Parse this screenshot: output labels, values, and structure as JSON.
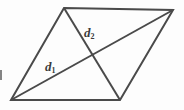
{
  "figure": {
    "name": "parallelogram-with-diagonals",
    "background_color": "#fdfdfd",
    "stroke_color": "#4a4a4a",
    "stroke_width": 2,
    "label_color": "#3a3a3a",
    "canvas": {
      "width": 184,
      "height": 110
    },
    "vertices": {
      "top_left": {
        "x": 64,
        "y": 8
      },
      "top_right": {
        "x": 173,
        "y": 10
      },
      "bottom_right": {
        "x": 120,
        "y": 100
      },
      "bottom_left": {
        "x": 11,
        "y": 100
      }
    },
    "outline_points": "64,8 173,10 120,100 11,100",
    "diagonals": [
      {
        "id": "d1",
        "label_base": "d",
        "label_sub": "1",
        "from": {
          "x": 11,
          "y": 100
        },
        "to": {
          "x": 173,
          "y": 10
        },
        "label_position": {
          "x": 45,
          "y": 60
        }
      },
      {
        "id": "d2",
        "label_base": "d",
        "label_sub": "2",
        "from": {
          "x": 64,
          "y": 8
        },
        "to": {
          "x": 120,
          "y": 100
        },
        "label_position": {
          "x": 84,
          "y": 26
        }
      }
    ],
    "intersection": {
      "x": 92,
      "y": 55
    }
  }
}
